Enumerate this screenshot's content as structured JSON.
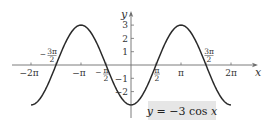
{
  "chart_data": {
    "type": "line",
    "title": "",
    "function": "y = -3 cos x",
    "xlabel": "x",
    "ylabel": "y",
    "xlim": [
      -6.2832,
      6.2832
    ],
    "ylim": [
      -3,
      3
    ],
    "grid": false,
    "legend": null,
    "annotation": {
      "text": "y = −3 cos x",
      "position": "lower-right",
      "boxed": true,
      "box_color": "#e6e6e6"
    },
    "x_ticks": [
      {
        "value": -6.2832,
        "label": "−2π",
        "position": "below"
      },
      {
        "value": -3.1416,
        "label": "−π",
        "position": "below"
      },
      {
        "value": -1.5708,
        "label": "−π/2",
        "position": "below",
        "fraction": {
          "sign": "−",
          "num": "π",
          "den": "2"
        }
      },
      {
        "value": 1.5708,
        "label": "π/2",
        "position": "below",
        "fraction": {
          "sign": "",
          "num": "π",
          "den": "2"
        }
      },
      {
        "value": 3.1416,
        "label": "π",
        "position": "below"
      },
      {
        "value": 6.2832,
        "label": "2π",
        "position": "below"
      }
    ],
    "x_annotations": [
      {
        "value": -4.7124,
        "label": "−3π/2",
        "position": "above",
        "fraction": {
          "sign": "−",
          "num": "3π",
          "den": "2"
        }
      },
      {
        "value": 4.7124,
        "label": "3π/2",
        "position": "above",
        "fraction": {
          "sign": "",
          "num": "3π",
          "den": "2"
        }
      }
    ],
    "y_ticks": [
      {
        "value": 3,
        "label": "3"
      },
      {
        "value": 2,
        "label": "2"
      },
      {
        "value": 1,
        "label": "1"
      },
      {
        "value": -1,
        "label": "−1"
      },
      {
        "value": -2,
        "label": "−2"
      }
    ],
    "series": [
      {
        "name": "y = -3 cos x",
        "x": [
          -6.2832,
          -4.7124,
          -3.1416,
          -1.5708,
          0,
          1.5708,
          3.1416,
          4.7124,
          6.2832
        ],
        "y": [
          -3,
          0,
          3,
          0,
          -3,
          0,
          3,
          0,
          -3
        ],
        "color": "#2a2a2a"
      }
    ],
    "layout": {
      "origin_px": [
        131,
        65
      ],
      "px_per_pi": 50,
      "px_per_unit_y": 13.3,
      "x_axis_px": [
        12,
        258
      ],
      "y_axis_px": [
        11,
        118
      ]
    }
  }
}
